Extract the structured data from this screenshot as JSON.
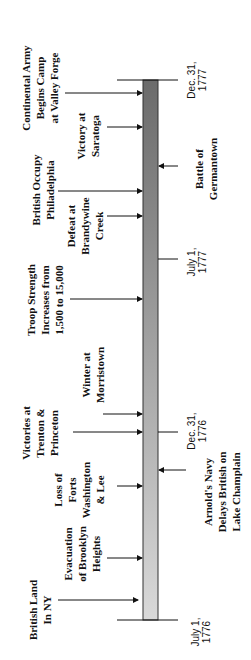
{
  "colors": {
    "bar_top": "#6b6b6b",
    "bar_bottom": "#d9d9d9",
    "ink": "#111111"
  },
  "dates": [
    {
      "id": "july-1776",
      "lines": [
        "July 1,",
        "1776"
      ]
    },
    {
      "id": "dec-1776",
      "lines": [
        "Dec. 31,",
        "1776"
      ]
    },
    {
      "id": "july-1777",
      "lines": [
        "July 1,",
        "1777"
      ]
    },
    {
      "id": "dec-1777",
      "lines": [
        "Dec. 31,",
        "1777"
      ]
    }
  ],
  "events": [
    {
      "id": "british-land-ny",
      "side": "left",
      "lines": [
        "British Land",
        "In NY"
      ]
    },
    {
      "id": "evacuation-brooklyn",
      "side": "left",
      "lines": [
        "Evacuation",
        "of Brooklyn",
        "Heights"
      ]
    },
    {
      "id": "loss-forts",
      "side": "left",
      "lines": [
        "Loss of",
        "Forts",
        "Washington",
        "& Lee"
      ]
    },
    {
      "id": "arnolds-navy",
      "side": "right",
      "lines": [
        "Arnold's Navy",
        "Delays British on",
        "Lake Champlain"
      ]
    },
    {
      "id": "trenton-princeton",
      "side": "left",
      "lines": [
        "Victories at",
        "Trenton &",
        "Princeton"
      ]
    },
    {
      "id": "winter-morristown",
      "side": "left",
      "lines": [
        "Winter at",
        "Morristown"
      ]
    },
    {
      "id": "troop-strength",
      "side": "left",
      "lines": [
        "Troop Strength",
        "Increases from",
        "1,500 to 15,000"
      ]
    },
    {
      "id": "defeat-brandywine",
      "side": "left",
      "lines": [
        "Defeat at",
        "Brandywine",
        "Creek"
      ]
    },
    {
      "id": "battle-germantown",
      "side": "right",
      "lines": [
        "Battle of",
        "Germantown"
      ]
    },
    {
      "id": "british-occupy-philadelphia",
      "side": "left",
      "lines": [
        "British Occupy",
        "Philadelphia"
      ]
    },
    {
      "id": "victory-saratoga",
      "side": "left",
      "lines": [
        "Victory at",
        "Saratoga"
      ]
    },
    {
      "id": "valley-forge",
      "side": "left",
      "lines": [
        "Continental Army",
        "Begins Camp",
        "at Valley Forge"
      ]
    }
  ]
}
